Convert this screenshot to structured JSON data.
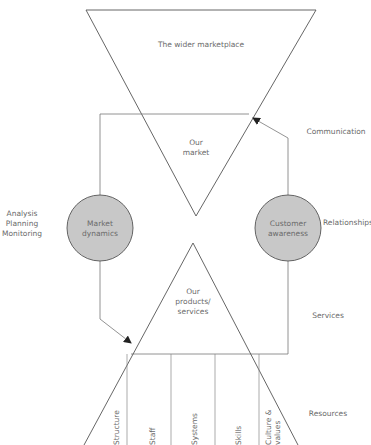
{
  "diagram": {
    "top_triangle": {
      "label": "The wider marketplace",
      "inner_label": "Our\nmarket"
    },
    "bottom_triangle": {
      "label": "Our\nproducts/\nservices"
    },
    "left_circle": {
      "label": "Market\ndynamics",
      "fill": "#c8c8c8"
    },
    "right_circle": {
      "label": "Customer\nawareness",
      "fill": "#c8c8c8"
    },
    "left_annotation": [
      "Analysis",
      "Planning",
      "Monitoring"
    ],
    "right_annotations": {
      "communication": "Communication",
      "relationships": "Relationships",
      "services": "Services",
      "resources": "Resources"
    },
    "resource_columns": [
      "Structure",
      "Staff",
      "Systems",
      "Skills",
      "Culture &\nvalues"
    ],
    "colors": {
      "line": "#555555",
      "circle_fill": "#c8c8c8",
      "text": "#6a6a6a"
    }
  }
}
